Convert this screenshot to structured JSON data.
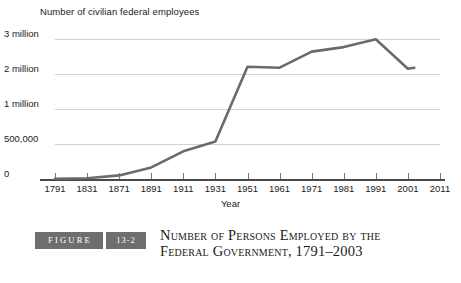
{
  "figure": {
    "badge_label": "FIGURE",
    "badge_number": "13-2",
    "caption_line1": "Number of Persons Employed by the",
    "caption_line2": "Federal Government, 1791–2003",
    "badge_color": "#6e6e6e"
  },
  "chart_data": {
    "type": "line",
    "title": "",
    "xlabel": "Year",
    "ylabel": "Number of civilian federal employees",
    "grid": true,
    "legend": "none",
    "line_color": "#6b6b6b",
    "axis_note": "non-linear y scale; evenly spaced category x axis",
    "x_tick_labels": [
      "1791",
      "1831",
      "1871",
      "1891",
      "1911",
      "1931",
      "1951",
      "1961",
      "1971",
      "1981",
      "1991",
      "2001",
      "2011"
    ],
    "y_tick_labels": [
      "0",
      "500,000",
      "1 million",
      "2 million",
      "3 million"
    ],
    "y_tick_values": [
      0,
      500000,
      1000000,
      2000000,
      3000000
    ],
    "categories": [
      "1791",
      "1831",
      "1871",
      "1891",
      "1911",
      "1931",
      "1951",
      "1961",
      "1971",
      "1981",
      "1991",
      "2001",
      "2003"
    ],
    "values": [
      5000,
      12000,
      51000,
      166000,
      396000,
      536000,
      2210000,
      2180000,
      2640000,
      2770000,
      2990000,
      2150000,
      2180000
    ],
    "series": [
      {
        "name": "Civilian federal employees",
        "values": [
          5000,
          12000,
          51000,
          166000,
          396000,
          536000,
          2210000,
          2180000,
          2640000,
          2770000,
          2990000,
          2150000,
          2180000
        ]
      }
    ],
    "annotations": []
  }
}
